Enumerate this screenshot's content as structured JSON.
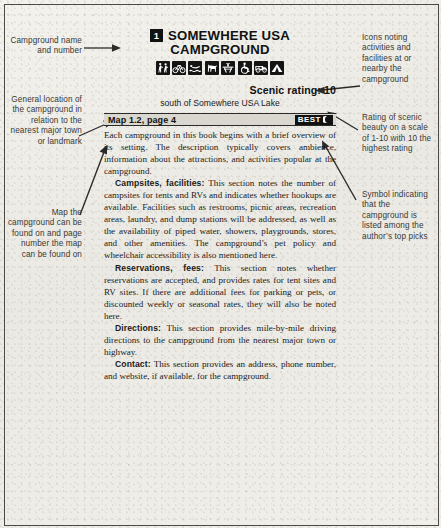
{
  "entry": {
    "number": "1",
    "title_line1": "SOMEWHERE USA",
    "title_line2": "CAMPGROUND",
    "icons": [
      {
        "name": "hiking-icon",
        "label": "Hiking"
      },
      {
        "name": "biking-icon",
        "label": "Biking"
      },
      {
        "name": "swimming-icon",
        "label": "Swimming"
      },
      {
        "name": "pets-icon",
        "label": "Pets allowed"
      },
      {
        "name": "picnic-icon",
        "label": "Picnic area"
      },
      {
        "name": "wheelchair-icon",
        "label": "Wheelchair accessible"
      },
      {
        "name": "rv-icon",
        "label": "RV sites"
      },
      {
        "name": "tent-icon",
        "label": "Tent sites"
      }
    ],
    "scenic_rating": "Scenic rating: 10",
    "location": "south of Somewhere USA Lake",
    "map_label": "Map 1.2, page 4",
    "best_badge": "BEST",
    "paragraphs": [
      {
        "heading": "",
        "text": "Each campground in this book begins with a brief overview of its setting. The description typically covers ambience, information about the attractions, and activities popular at the campground."
      },
      {
        "heading": "Campsites, facilities:",
        "text": " This section notes the number of campsites for tents and RVs and indicates whether hookups are available. Facilities such as restrooms, picnic areas, recreation areas, laundry, and dump stations will be addressed, as well as the availability of piped water, showers, playgrounds, stores, and other amenities. The campground’s pet policy and wheelchair accessibility is also mentioned here."
      },
      {
        "heading": "Reservations, fees:",
        "text": " This section notes whether reservations are accepted, and provides rates for tent sites and RV sites. If there are additional fees for parking or pets, or discounted weekly or seasonal rates, they will also be noted here."
      },
      {
        "heading": "Directions:",
        "text": " This section provides mile-by-mile driving directions to the campground from the nearest major town or highway."
      },
      {
        "heading": "Contact:",
        "text": " This section provides an address, phone number, and website, if available, for the campground."
      }
    ]
  },
  "callouts": {
    "left": [
      {
        "name": "callout-name-number",
        "text": "Campground name and number"
      },
      {
        "name": "callout-general-location",
        "text": "General location of the campground in relation to the nearest major town or landmark"
      },
      {
        "name": "callout-map-page",
        "text": "Map the campground can be found on and page number the map can be found on"
      }
    ],
    "right": [
      {
        "name": "callout-icons",
        "text": "Icons noting activities and facilities at or nearby the campground"
      },
      {
        "name": "callout-scenic-rating",
        "text": "Rating of scenic beauty on a scale of 1-10 with 10 the highest rating"
      },
      {
        "name": "callout-best-symbol",
        "text": "Symbol indicating that the campground is listed among the author’s top picks"
      }
    ]
  },
  "colors": {
    "ink": "#121212",
    "paper": "#efeee9",
    "map_bar": "#d9d7d0",
    "annotation": "#3a3936"
  }
}
